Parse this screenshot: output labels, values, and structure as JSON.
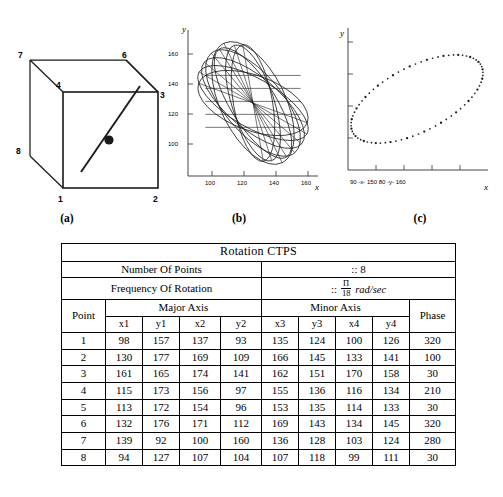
{
  "figure": {
    "panel_a": {
      "caption": "(a)",
      "vertex_labels": [
        "1",
        "2",
        "3",
        "4",
        "6",
        "7",
        "8"
      ],
      "vertices": [
        {
          "label": "7",
          "x": 14,
          "y": 22
        },
        {
          "label": "6",
          "x": 108,
          "y": 22
        },
        {
          "label": "4",
          "x": 47,
          "y": 53
        },
        {
          "label": "3",
          "x": 137,
          "y": 53
        },
        {
          "label": "8",
          "x": 14,
          "y": 118
        },
        {
          "label": "1",
          "x": 47,
          "y": 150
        },
        {
          "label": "2",
          "x": 137,
          "y": 150
        }
      ]
    },
    "panel_b": {
      "caption": "(b)",
      "xlabel": "x",
      "ylabel": "y",
      "xticks": [
        "100",
        "120",
        "140",
        "160"
      ],
      "yticks": [
        "100",
        "120",
        "140",
        "160"
      ]
    },
    "panel_c": {
      "caption": "(c)",
      "xlabel": "x",
      "ylabel": "y",
      "xaxis_text": "90  -x-  150     80  -y-  160"
    },
    "panel_d": {
      "caption": "(d)"
    }
  },
  "table": {
    "title": "Rotation CTPS",
    "rows_meta": [
      {
        "label": "Number Of Points",
        "value_prefix": "::",
        "value": "8"
      },
      {
        "label": "Frequency Of Rotation",
        "value_prefix": "::",
        "value_num": "Π",
        "value_den": "18",
        "value_unit": "rad/sec"
      }
    ],
    "headers": {
      "point": "Point",
      "major_axis": "Major Axis",
      "minor_axis": "Minor Axis",
      "phase": "Phase",
      "cols": [
        "x1",
        "y1",
        "x2",
        "y2",
        "x3",
        "y3",
        "x4",
        "y4"
      ]
    },
    "data": [
      {
        "point": "1",
        "x1": "98",
        "y1": "157",
        "x2": "137",
        "y2": "93",
        "x3": "135",
        "y3": "124",
        "x4": "100",
        "y4": "126",
        "phase": "320"
      },
      {
        "point": "2",
        "x1": "130",
        "y1": "177",
        "x2": "169",
        "y2": "109",
        "x3": "166",
        "y3": "145",
        "x4": "133",
        "y4": "141",
        "phase": "100"
      },
      {
        "point": "3",
        "x1": "161",
        "y1": "165",
        "x2": "174",
        "y2": "141",
        "x3": "162",
        "y3": "151",
        "x4": "170",
        "y4": "158",
        "phase": "30"
      },
      {
        "point": "4",
        "x1": "115",
        "y1": "173",
        "x2": "156",
        "y2": "97",
        "x3": "155",
        "y3": "136",
        "x4": "116",
        "y4": "134",
        "phase": "210"
      },
      {
        "point": "5",
        "x1": "113",
        "y1": "172",
        "x2": "154",
        "y2": "96",
        "x3": "153",
        "y3": "135",
        "x4": "114",
        "y4": "133",
        "phase": "30"
      },
      {
        "point": "6",
        "x1": "132",
        "y1": "176",
        "x2": "171",
        "y2": "112",
        "x3": "169",
        "y3": "143",
        "x4": "134",
        "y4": "145",
        "phase": "320"
      },
      {
        "point": "7",
        "x1": "139",
        "y1": "92",
        "x2": "100",
        "y2": "160",
        "x3": "136",
        "y3": "128",
        "x4": "103",
        "y4": "124",
        "phase": "280"
      },
      {
        "point": "8",
        "x1": "94",
        "y1": "127",
        "x2": "107",
        "y2": "104",
        "x3": "107",
        "y3": "118",
        "x4": "99",
        "y4": "111",
        "phase": "30"
      }
    ]
  },
  "chart_data": [
    {
      "type": "line",
      "panel": "b",
      "title": "",
      "xlabel": "x",
      "ylabel": "y",
      "xlim": [
        88,
        178
      ],
      "ylim": [
        88,
        178
      ],
      "xticks": [
        100,
        120,
        140,
        160
      ],
      "yticks": [
        100,
        120,
        140,
        160
      ],
      "grid": false,
      "legend": "none",
      "description": "Eight overlapping rotated ellipses (loci of rotating CTPS points) drawn as continuous closed curves with connecting chords.",
      "series": [
        {
          "name": "ellipse-1",
          "cx": 133,
          "cy": 133,
          "rx": 44,
          "ry": 14,
          "angle_deg": -58
        },
        {
          "name": "ellipse-2",
          "cx": 133,
          "cy": 133,
          "rx": 44,
          "ry": 16,
          "angle_deg": -40
        },
        {
          "name": "ellipse-3",
          "cx": 133,
          "cy": 133,
          "rx": 42,
          "ry": 13,
          "angle_deg": -72
        },
        {
          "name": "ellipse-4",
          "cx": 133,
          "cy": 133,
          "rx": 45,
          "ry": 18,
          "angle_deg": -50
        },
        {
          "name": "ellipse-5",
          "cx": 133,
          "cy": 133,
          "rx": 43,
          "ry": 15,
          "angle_deg": -30
        },
        {
          "name": "ellipse-6",
          "cx": 133,
          "cy": 133,
          "rx": 41,
          "ry": 12,
          "angle_deg": -80
        },
        {
          "name": "ellipse-7",
          "cx": 133,
          "cy": 133,
          "rx": 46,
          "ry": 20,
          "angle_deg": -64
        },
        {
          "name": "ellipse-8",
          "cx": 133,
          "cy": 133,
          "rx": 40,
          "ry": 17,
          "angle_deg": -20
        }
      ]
    },
    {
      "type": "scatter",
      "panel": "c",
      "title": "",
      "xlabel": "x",
      "ylabel": "y",
      "xaxis_text": "90  -x-  150     80  -y-  160",
      "xlim": [
        90,
        150
      ],
      "ylim": [
        80,
        160
      ],
      "grid": false,
      "legend": "none",
      "description": "Single rotated elliptical point-cloud trajectory of one CTPS point over a full rotation; dense markers along the ellipse perimeter.",
      "ellipse": {
        "cx": 120,
        "cy": 120,
        "rx": 36,
        "ry": 18,
        "angle_deg": -38,
        "n_points": 72
      }
    }
  ]
}
